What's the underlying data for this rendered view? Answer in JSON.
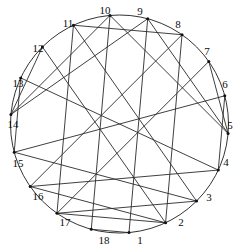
{
  "figure": {
    "vertex_count": 18,
    "stroke_color": "#2a2a2a",
    "circle_color": "#1c1c1c",
    "background_color": "#ffffff",
    "label_color": "#0d0d0d"
  },
  "chart_data": {
    "type": "diagram",
    "layout": "circular",
    "title": "",
    "xlabel": "",
    "ylabel": "",
    "grid": false,
    "legend": null,
    "circle": {
      "cx": 119.5,
      "cy": 124.0,
      "r": 109.0
    },
    "vertex_start_angle_deg": 95,
    "vertex_direction": "counterclockwise",
    "nodes": [
      {
        "id": 1,
        "label": "1",
        "angle_deg": 275,
        "label_x": 140,
        "label_y": 240
      },
      {
        "id": 2,
        "label": "2",
        "angle_deg": 295,
        "label_x": 181,
        "label_y": 222
      },
      {
        "id": 3,
        "label": "3",
        "angle_deg": 315,
        "label_x": 209,
        "label_y": 197
      },
      {
        "id": 4,
        "label": "4",
        "angle_deg": 335,
        "label_x": 226,
        "label_y": 162
      },
      {
        "id": 5,
        "label": "5",
        "angle_deg": 355,
        "label_x": 230,
        "label_y": 125
      },
      {
        "id": 6,
        "label": "6",
        "angle_deg": 15,
        "label_x": 225,
        "label_y": 84
      },
      {
        "id": 7,
        "label": "7",
        "angle_deg": 35,
        "label_x": 207,
        "label_y": 51
      },
      {
        "id": 8,
        "label": "8",
        "angle_deg": 55,
        "label_x": 178,
        "label_y": 24
      },
      {
        "id": 9,
        "label": "9",
        "angle_deg": 75,
        "label_x": 140,
        "label_y": 11
      },
      {
        "id": 10,
        "label": "10",
        "angle_deg": 95,
        "label_x": 105,
        "label_y": 10
      },
      {
        "id": 11,
        "label": "11",
        "angle_deg": 115,
        "label_x": 68,
        "label_y": 23
      },
      {
        "id": 12,
        "label": "12",
        "angle_deg": 135,
        "label_x": 38,
        "label_y": 48
      },
      {
        "id": 13,
        "label": "13",
        "angle_deg": 155,
        "label_x": 18,
        "label_y": 83
      },
      {
        "id": 14,
        "label": "14",
        "angle_deg": 175,
        "label_x": 13,
        "label_y": 124
      },
      {
        "id": 15,
        "label": "15",
        "angle_deg": 195,
        "label_x": 18,
        "label_y": 163
      },
      {
        "id": 16,
        "label": "16",
        "angle_deg": 215,
        "label_x": 38,
        "label_y": 196
      },
      {
        "id": 17,
        "label": "17",
        "angle_deg": 235,
        "label_x": 65,
        "label_y": 222
      },
      {
        "id": 18,
        "label": "18",
        "angle_deg": 255,
        "label_x": 104,
        "label_y": 240
      }
    ],
    "edges": [
      [
        10,
        18
      ],
      [
        9,
        1
      ],
      [
        11,
        17
      ],
      [
        8,
        2
      ],
      [
        12,
        14
      ],
      [
        7,
        5
      ],
      [
        13,
        4
      ],
      [
        6,
        15
      ],
      [
        10,
        14
      ],
      [
        9,
        5
      ],
      [
        11,
        3
      ],
      [
        8,
        16
      ],
      [
        10,
        5
      ],
      [
        9,
        14
      ],
      [
        12,
        2
      ],
      [
        7,
        17
      ],
      [
        15,
        3
      ],
      [
        4,
        16
      ],
      [
        16,
        2
      ],
      [
        3,
        17
      ],
      [
        18,
        1
      ],
      [
        17,
        2
      ],
      [
        13,
        15
      ],
      [
        6,
        4
      ],
      [
        11,
        8
      ]
    ]
  }
}
